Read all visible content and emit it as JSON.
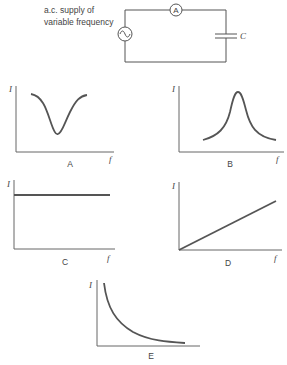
{
  "circuit": {
    "supply_label_line1": "a.c. supply of",
    "supply_label_line2": "variable frequency",
    "ammeter_symbol": "A",
    "capacitor_label": "C",
    "source_icon": "ac-source-icon"
  },
  "graphs": [
    {
      "id": "A",
      "label": "A",
      "y_axis": "I",
      "x_axis": "f",
      "shape": "dip"
    },
    {
      "id": "B",
      "label": "B",
      "y_axis": "I",
      "x_axis": "f",
      "shape": "peak"
    },
    {
      "id": "C",
      "label": "C",
      "y_axis": "I",
      "x_axis": "f",
      "shape": "constant"
    },
    {
      "id": "D",
      "label": "D",
      "y_axis": "I",
      "x_axis": "f",
      "shape": "linear-increase"
    },
    {
      "id": "E",
      "label": "E",
      "y_axis": "I",
      "x_axis": "",
      "shape": "inverse-decay"
    }
  ]
}
